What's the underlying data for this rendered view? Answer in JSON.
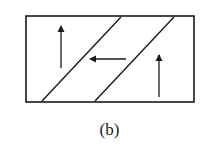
{
  "figure": {
    "caption": "(b)",
    "colors": {
      "stroke": "#1a1a1a",
      "background": "#ffffff"
    },
    "frame": {
      "x": 26,
      "y": 16,
      "width": 168,
      "height": 86
    },
    "diagonals": [
      {
        "name": "diagonal-line-left",
        "x1": 42,
        "y1": 101,
        "x2": 121,
        "y2": 17
      },
      {
        "name": "diagonal-line-right",
        "x1": 95,
        "y1": 101,
        "x2": 174,
        "y2": 17
      }
    ],
    "arrows": [
      {
        "name": "arrow-up-left-region",
        "direction": "up",
        "x1": 61,
        "y1": 68,
        "x2": 61,
        "y2": 26
      },
      {
        "name": "arrow-left-middle-band",
        "direction": "left",
        "x1": 126,
        "y1": 59,
        "x2": 90,
        "y2": 59
      },
      {
        "name": "arrow-up-right-region",
        "direction": "up",
        "x1": 159,
        "y1": 97,
        "x2": 159,
        "y2": 55
      }
    ]
  }
}
